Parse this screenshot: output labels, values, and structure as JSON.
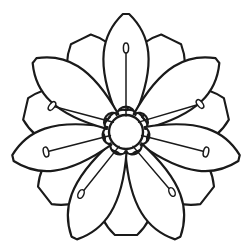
{
  "artwork": {
    "title": "Flower Line Art",
    "subject": "seven-petal-flower",
    "style": "coloring-book-outline",
    "background_color": "#ffffff",
    "stroke_color": "#1a1a1a",
    "fill_color": "#ffffff",
    "canvas": {
      "width": 252,
      "height": 248
    },
    "center": {
      "cx": 126,
      "cy": 132,
      "radius": 17
    },
    "petal_count_front": 7,
    "petal_count_back": 7,
    "stamen_count": 7,
    "front_petals": [
      {
        "name": "petal-top",
        "angle_deg": -90,
        "tip_x": 126,
        "tip_y": 14,
        "length": 118,
        "width": 62
      },
      {
        "name": "petal-upper-right",
        "angle_deg": -38,
        "tip_x": 219,
        "tip_y": 86,
        "length": 116,
        "width": 62
      },
      {
        "name": "petal-right",
        "angle_deg": 13,
        "tip_x": 241,
        "tip_y": 158,
        "length": 116,
        "width": 60
      },
      {
        "name": "petal-lower-right",
        "angle_deg": 64,
        "tip_x": 178,
        "tip_y": 236,
        "length": 118,
        "width": 60
      },
      {
        "name": "petal-lower-left",
        "angle_deg": 116,
        "tip_x": 74,
        "tip_y": 236,
        "length": 118,
        "width": 60
      },
      {
        "name": "petal-left",
        "angle_deg": 167,
        "tip_x": 11,
        "tip_y": 158,
        "length": 116,
        "width": 60
      },
      {
        "name": "petal-upper-left",
        "angle_deg": -142,
        "tip_x": 33,
        "tip_y": 86,
        "length": 116,
        "width": 62
      }
    ],
    "back_petals": [
      {
        "name": "back-petal-top-right",
        "angle_deg": -64
      },
      {
        "name": "back-petal-right",
        "angle_deg": -13
      },
      {
        "name": "back-petal-lower-right",
        "angle_deg": 38
      },
      {
        "name": "back-petal-bottom",
        "angle_deg": 90
      },
      {
        "name": "back-petal-lower-left",
        "angle_deg": 142
      },
      {
        "name": "back-petal-left",
        "angle_deg": 193
      },
      {
        "name": "back-petal-top-left",
        "angle_deg": 244
      }
    ],
    "stamens": [
      {
        "name": "stamen-top",
        "angle_deg": -90,
        "tip_x": 126,
        "tip_y": 48,
        "anther_rx": 2.6,
        "anther_ry": 5.0
      },
      {
        "name": "stamen-upper-right",
        "angle_deg": -38,
        "tip_x": 200,
        "tip_y": 104,
        "anther_rx": 5.0,
        "anther_ry": 2.6
      },
      {
        "name": "stamen-right",
        "angle_deg": 13,
        "tip_x": 206,
        "tip_y": 152,
        "anther_rx": 5.0,
        "anther_ry": 2.6
      },
      {
        "name": "stamen-lower-right",
        "angle_deg": 64,
        "tip_x": 172,
        "tip_y": 192,
        "anther_rx": 2.8,
        "anther_ry": 4.6
      },
      {
        "name": "stamen-lower-left",
        "angle_deg": 116,
        "tip_x": 81,
        "tip_y": 194,
        "anther_rx": 2.8,
        "anther_ry": 4.6
      },
      {
        "name": "stamen-left",
        "angle_deg": 167,
        "tip_x": 46,
        "tip_y": 152,
        "anther_rx": 5.0,
        "anther_ry": 2.6
      },
      {
        "name": "stamen-upper-left",
        "angle_deg": -142,
        "tip_x": 52,
        "tip_y": 106,
        "anther_rx": 5.0,
        "anther_ry": 2.6
      }
    ]
  }
}
